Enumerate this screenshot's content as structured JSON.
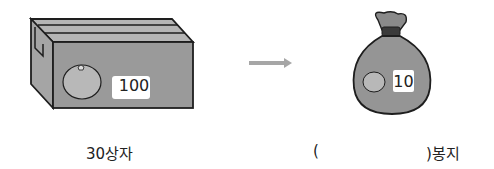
{
  "box": {
    "count_label": "100",
    "caption": "30상자"
  },
  "arrow": {
    "direction": "right"
  },
  "bag": {
    "count_label": "10",
    "caption_open": "(",
    "caption_close": ")봉지",
    "answer": ""
  },
  "colors": {
    "box_front": "#9a9a9a",
    "box_top": "#b5b5b5",
    "bag": "#959595",
    "arrow": "#a6a6a6",
    "outline": "#1e1e1e",
    "fruit": "#b8b8b8"
  }
}
